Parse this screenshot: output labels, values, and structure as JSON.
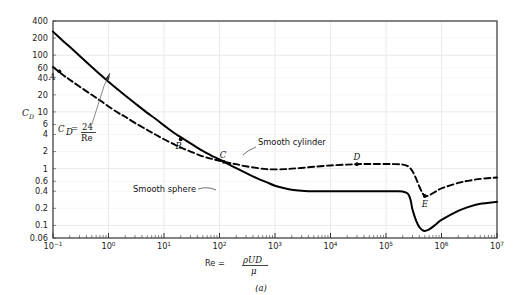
{
  "figure": {
    "caption": "(a)",
    "x_axis_label_prefix": "Re =",
    "x_axis_numerator": "ρUD",
    "x_axis_denominator": "μ",
    "y_axis_label": "C",
    "y_axis_label_sub": "D"
  },
  "annotations": {
    "equation_lhs": "C",
    "equation_lhs_sub": "D",
    "equation_eq": "=",
    "equation_num": "24",
    "equation_den": "Re",
    "cylinder_label": "Smooth cylinder",
    "sphere_label": "Smooth sphere"
  },
  "colors": {
    "grid": "#e9e9e9",
    "frame": "#333333",
    "curve": "#000000",
    "text": "#1a1a1a"
  },
  "chart_data": {
    "type": "line",
    "title": "",
    "xlabel": "Re = ρUD/μ",
    "ylabel": "C_D",
    "xscale": "log",
    "yscale": "log",
    "xlim": [
      0.1,
      10000000
    ],
    "ylim": [
      0.06,
      400
    ],
    "grid": true,
    "legend": "inline-annotations",
    "x_tick_labels": [
      "10⁻¹",
      "10⁰",
      "10¹",
      "10²",
      "10³",
      "10⁴",
      "10⁵",
      "10⁶",
      "10⁷"
    ],
    "x_tick_values": [
      0.1,
      1,
      10,
      100,
      1000,
      10000,
      100000,
      1000000,
      10000000
    ],
    "y_tick_labels": [
      "400",
      "200",
      "100",
      "60",
      "40",
      "20",
      "10",
      "6",
      "4",
      "2",
      "1",
      "0.6",
      "0.4",
      "0.2",
      "0.1",
      "0.06"
    ],
    "y_tick_values": [
      400,
      200,
      100,
      60,
      40,
      20,
      10,
      6,
      4,
      2,
      1,
      0.6,
      0.4,
      0.2,
      0.1,
      0.06
    ],
    "series": [
      {
        "name": "Smooth sphere",
        "style": "solid",
        "points": [
          [
            0.1,
            260
          ],
          [
            0.15,
            180
          ],
          [
            0.2,
            140
          ],
          [
            0.3,
            98
          ],
          [
            0.5,
            62
          ],
          [
            0.7,
            46
          ],
          [
            1.0,
            34
          ],
          [
            1.5,
            24.5
          ],
          [
            2.0,
            19.5
          ],
          [
            3.0,
            14.2
          ],
          [
            5.0,
            9.6
          ],
          [
            7.0,
            7.6
          ],
          [
            10,
            5.8
          ],
          [
            15,
            4.3
          ],
          [
            20,
            3.6
          ],
          [
            30,
            2.8
          ],
          [
            50,
            2.05
          ],
          [
            70,
            1.72
          ],
          [
            100,
            1.45
          ],
          [
            150,
            1.18
          ],
          [
            200,
            1.02
          ],
          [
            300,
            0.84
          ],
          [
            500,
            0.66
          ],
          [
            700,
            0.58
          ],
          [
            1000,
            0.5
          ],
          [
            1500,
            0.45
          ],
          [
            2000,
            0.425
          ],
          [
            3000,
            0.41
          ],
          [
            5000,
            0.4
          ],
          [
            10000,
            0.4
          ],
          [
            30000,
            0.4
          ],
          [
            100000,
            0.4
          ],
          [
            150000,
            0.4
          ],
          [
            200000,
            0.395
          ],
          [
            250000,
            0.36
          ],
          [
            280000,
            0.27
          ],
          [
            300000,
            0.19
          ],
          [
            350000,
            0.12
          ],
          [
            400000,
            0.093
          ],
          [
            450000,
            0.083
          ],
          [
            500000,
            0.08
          ],
          [
            600000,
            0.085
          ],
          [
            800000,
            0.105
          ],
          [
            1000000,
            0.125
          ],
          [
            2000000,
            0.18
          ],
          [
            3000000,
            0.21
          ],
          [
            5000000,
            0.24
          ],
          [
            10000000,
            0.26
          ]
        ]
      },
      {
        "name": "Smooth cylinder",
        "style": "dashed",
        "points": [
          [
            0.1,
            62
          ],
          [
            0.15,
            45
          ],
          [
            0.2,
            37
          ],
          [
            0.3,
            28
          ],
          [
            0.5,
            20
          ],
          [
            0.7,
            16
          ],
          [
            1.0,
            12.5
          ],
          [
            1.5,
            9.6
          ],
          [
            2.0,
            8.2
          ],
          [
            3.0,
            6.4
          ],
          [
            5.0,
            4.8
          ],
          [
            7.0,
            4.0
          ],
          [
            10,
            3.3
          ],
          [
            15,
            2.7
          ],
          [
            20,
            2.35
          ],
          [
            30,
            2.0
          ],
          [
            50,
            1.65
          ],
          [
            70,
            1.5
          ],
          [
            100,
            1.38
          ],
          [
            150,
            1.26
          ],
          [
            200,
            1.2
          ],
          [
            300,
            1.1
          ],
          [
            500,
            1.02
          ],
          [
            700,
            0.98
          ],
          [
            1000,
            0.97
          ],
          [
            1500,
            0.98
          ],
          [
            2000,
            1.0
          ],
          [
            3000,
            1.03
          ],
          [
            5000,
            1.08
          ],
          [
            10000,
            1.14
          ],
          [
            20000,
            1.18
          ],
          [
            30000,
            1.2
          ],
          [
            50000,
            1.21
          ],
          [
            100000,
            1.21
          ],
          [
            150000,
            1.2
          ],
          [
            200000,
            1.18
          ],
          [
            250000,
            1.1
          ],
          [
            300000,
            0.9
          ],
          [
            350000,
            0.66
          ],
          [
            400000,
            0.48
          ],
          [
            450000,
            0.38
          ],
          [
            500000,
            0.33
          ],
          [
            600000,
            0.34
          ],
          [
            800000,
            0.4
          ],
          [
            1000000,
            0.45
          ],
          [
            2000000,
            0.56
          ],
          [
            3000000,
            0.61
          ],
          [
            5000000,
            0.66
          ],
          [
            10000000,
            0.7
          ]
        ]
      }
    ],
    "labeled_points": [
      {
        "label": "A",
        "series": "Smooth cylinder",
        "x": 0.13,
        "y": 52
      },
      {
        "label": "B",
        "series": "Smooth sphere",
        "x": 20,
        "y": 3.3
      },
      {
        "label": "C",
        "series": "Smooth cylinder",
        "x": 120,
        "y": 1.32
      },
      {
        "label": "D",
        "series": "Smooth cylinder",
        "x": 30000,
        "y": 1.2
      },
      {
        "label": "E",
        "series": "Smooth cylinder",
        "x": 500000,
        "y": 0.33
      }
    ]
  }
}
